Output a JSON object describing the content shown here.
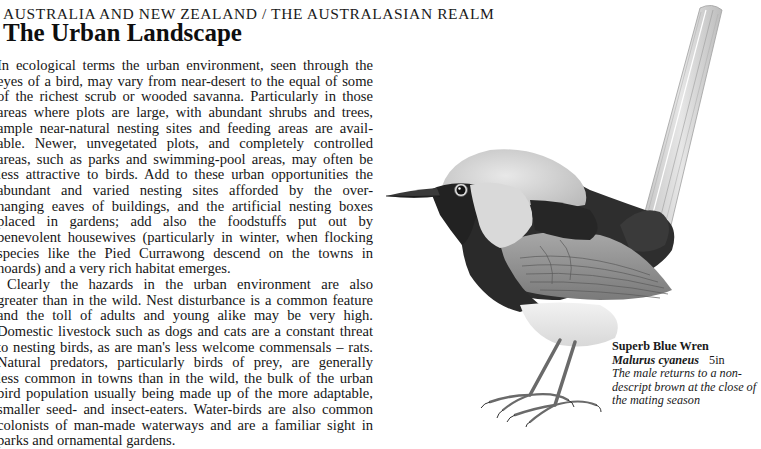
{
  "header": {
    "section": "AUSTRALIA AND NEW ZEALAND / THE AUSTRALASIAN REALM",
    "title": "The Urban Landscape"
  },
  "body": {
    "lines": [
      "In ecological terms the urban environment, seen through the",
      "eyes of a bird, may vary from near-desert to the equal of some",
      "of the richest scrub or wooded savanna. Particularly in those",
      "areas where plots are large, with abundant shrubs and trees,",
      "ample near-natural nesting sites and feeding areas are avail-",
      "able. Newer, unvegetated plots, and completely controlled",
      "areas, such as parks and swimming-pool areas, may often be",
      "less attractive to birds. Add to these urban opportunities the",
      "abundant and varied nesting sites afforded by the over-",
      "hanging eaves of buildings, and the artificial nesting boxes",
      "placed in gardens; add also the foodstuffs put out by",
      "benevolent housewives (particularly in winter, when flocking",
      "species like the Pied Currawong descend on the towns in",
      "hoards) and a very rich habitat emerges.",
      "Clearly the hazards in the urban environment are also",
      "greater than in the wild. Nest disturbance is a common feature",
      "and the toll of adults and young alike may be very high.",
      "Domestic livestock such as dogs and cats are a constant threat",
      "to nesting birds, as are man's less welcome commensals – rats.",
      "Natural predators, particularly birds of prey, are generally",
      "less common in towns than in the wild, the bulk of the urban",
      "bird population usually being made up of the more adaptable,",
      "smaller seed- and insect-eaters. Water-birds are also common",
      "colonists of man-made waterways and are a familiar sight in",
      "parks and ornamental gardens."
    ]
  },
  "illustration": {
    "subject": "bird-illustration",
    "palette": {
      "ink": "#161616",
      "dark_plumage": "#2b2b2b",
      "mid_plumage": "#6e6e6e",
      "light_plumage": "#c9c9c9",
      "tail": "#d6d6d6",
      "paper": "#ffffff"
    }
  },
  "caption": {
    "common_name": "Superb Blue Wren",
    "scientific_name": "Malurus cyaneus",
    "size": "5in",
    "description": "The male returns to a non-descript brown at the close of the mating season"
  }
}
